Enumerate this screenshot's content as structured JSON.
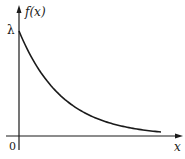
{
  "diagram": {
    "type": "function-plot",
    "y_axis_label": "f(x)",
    "x_axis_label": "x",
    "origin_label": "0",
    "intercept_label": "λ",
    "colors": {
      "axis": "#1a1a1a",
      "curve": "#1a1a1a",
      "background": "#ffffff"
    }
  },
  "chart_data": {
    "type": "line",
    "title": "",
    "xlabel": "x",
    "ylabel": "f(x)",
    "series": [
      {
        "name": "f(x) = λe^(-λx)",
        "shape": "exponential decay",
        "y_intercept": "λ"
      }
    ],
    "annotations": [
      "λ",
      "0"
    ],
    "grid": false
  }
}
